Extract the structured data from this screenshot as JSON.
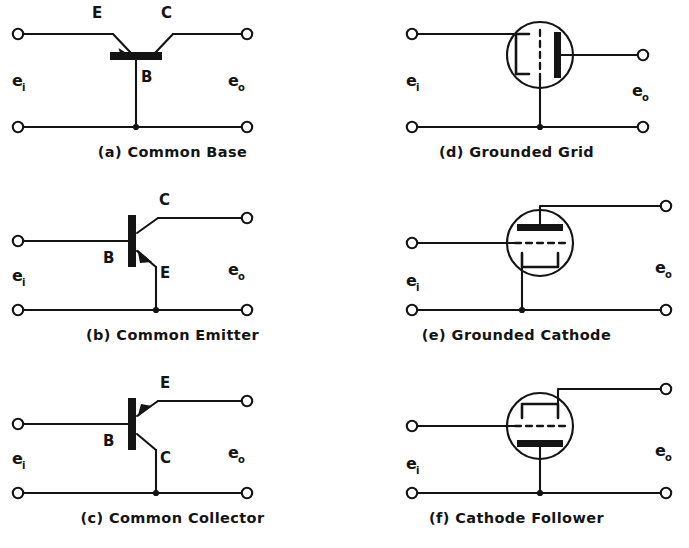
{
  "figure": {
    "background_color": "#ffffff",
    "ink_color": "#141414",
    "input_label": "e",
    "input_subscript": "i",
    "output_label": "e",
    "output_subscript": "o"
  },
  "circuits": [
    {
      "id": "a",
      "caption": "(a) Common Base",
      "device": "transistor",
      "terminal_labels": [
        "E",
        "C",
        "B"
      ],
      "input_label": "e",
      "input_subscript": "i",
      "output_label": "e",
      "output_subscript": "o",
      "common_terminal": "B"
    },
    {
      "id": "b",
      "caption": "(b) Common Emitter",
      "device": "transistor",
      "terminal_labels": [
        "C",
        "B",
        "E"
      ],
      "input_label": "e",
      "input_subscript": "i",
      "output_label": "e",
      "output_subscript": "o",
      "common_terminal": "E"
    },
    {
      "id": "c",
      "caption": "(c) Common Collector",
      "device": "transistor",
      "terminal_labels": [
        "E",
        "B",
        "C"
      ],
      "input_label": "e",
      "input_subscript": "i",
      "output_label": "e",
      "output_subscript": "o",
      "common_terminal": "C"
    },
    {
      "id": "d",
      "caption": "(d) Grounded Grid",
      "device": "vacuum-tube",
      "terminal_labels": [],
      "input_label": "e",
      "input_subscript": "i",
      "output_label": "e",
      "output_subscript": "o",
      "common_terminal": "grid"
    },
    {
      "id": "e",
      "caption": "(e) Grounded Cathode",
      "device": "vacuum-tube",
      "terminal_labels": [],
      "input_label": "e",
      "input_subscript": "i",
      "output_label": "e",
      "output_subscript": "o",
      "common_terminal": "cathode"
    },
    {
      "id": "f",
      "caption": "(f) Cathode Follower",
      "device": "vacuum-tube",
      "terminal_labels": [],
      "input_label": "e",
      "input_subscript": "i",
      "output_label": "e",
      "output_subscript": "o",
      "common_terminal": "plate"
    }
  ]
}
